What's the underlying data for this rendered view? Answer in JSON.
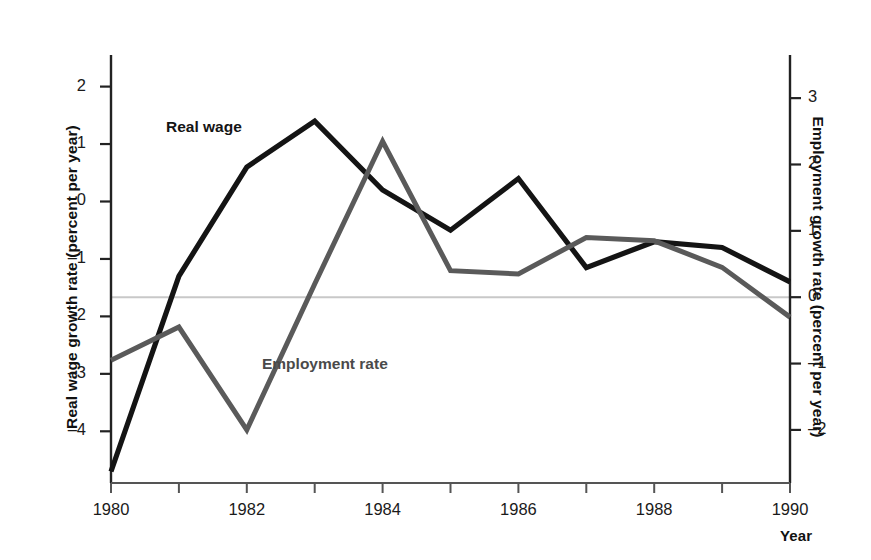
{
  "chart_data": {
    "type": "line",
    "title": "",
    "xlabel": "Year",
    "x": [
      1980,
      1981,
      1982,
      1983,
      1984,
      1985,
      1986,
      1987,
      1988,
      1989,
      1990
    ],
    "xtick_labels": [
      "1980",
      "",
      "1982",
      "",
      "1984",
      "",
      "1986",
      "",
      "1988",
      "",
      "1990"
    ],
    "xlim": [
      1980,
      1990
    ],
    "grid": false,
    "legend": "inline-labels",
    "reference_line": {
      "value": 0.0,
      "axis": "right",
      "color": "#c8c8c8"
    },
    "axes": [
      {
        "side": "left",
        "label": "Real wage growth rate (percent per year)",
        "ticks": [
          2,
          1,
          0,
          -1,
          -2,
          -3,
          -4
        ],
        "tick_labels": [
          "2",
          "1",
          "0",
          "–1",
          "–2",
          "–3",
          "–4"
        ],
        "lim": [
          -4.9,
          2.55
        ]
      },
      {
        "side": "right",
        "label": "Employment growth rate (percent per year)",
        "ticks": [
          3,
          2,
          1,
          0,
          -1,
          -2
        ],
        "tick_labels": [
          "3",
          "2",
          "1",
          "0",
          "–1",
          "–2"
        ],
        "lim": [
          -2.8,
          3.65
        ]
      }
    ],
    "series": [
      {
        "name": "Real wage",
        "axis": "left",
        "color": "#141414",
        "values": [
          -4.7,
          -1.3,
          0.6,
          1.4,
          0.2,
          -0.5,
          0.4,
          -1.15,
          -0.7,
          -0.8,
          -1.4
        ]
      },
      {
        "name": "Employment rate",
        "axis": "right",
        "color": "#5a5a5a",
        "values": [
          -0.95,
          -0.45,
          -2.0,
          0.2,
          2.35,
          0.4,
          0.35,
          0.9,
          0.85,
          0.45,
          -0.3
        ]
      }
    ]
  },
  "labels": {
    "realwage": "Real wage",
    "employment": "Employment rate",
    "xaxis_title": "Year",
    "yaxis_left_title": "Real wage growth rate (percent per year)",
    "yaxis_right_title": "Employment growth rate (percent per year)"
  }
}
